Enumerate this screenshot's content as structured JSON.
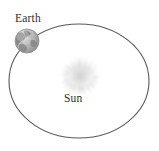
{
  "diagram": {
    "background_color": "#ffffff",
    "width": 159,
    "height": 151
  },
  "orbit": {
    "name": "earth-orbit-ellipse",
    "shape": "ellipse",
    "center_x": 79,
    "center_y": 81,
    "radius_x": 70,
    "radius_y": 57,
    "stroke_color": "#595959",
    "stroke_width": 1.1,
    "fill": "none"
  },
  "sun": {
    "label": "Sun",
    "icon": "sun-starburst-icon",
    "center_x": 80,
    "center_y": 76,
    "radius": 18,
    "core_color": "#d8d8d8",
    "glow_color": "#ebebeb",
    "ray_count": 20
  },
  "earth": {
    "label": "Earth",
    "icon": "earth-globe-icon",
    "center_x": 27,
    "center_y": 41,
    "radius": 12,
    "sphere_light_color": "#d5d5d5",
    "sphere_mid_color": "#b4b4b4",
    "sphere_shadow_color": "#8e8e8e",
    "landmass_color": "#7a7a7a",
    "outline_color": "#8a8a8a"
  },
  "labels": {
    "earth_text": "Earth",
    "sun_text": "Sun",
    "text_color": "#2f2f2f"
  }
}
